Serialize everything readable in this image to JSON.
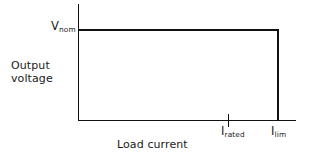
{
  "figure": {
    "background_color": "#ffffff",
    "line_color": "#111111",
    "text_color": "#1a1a1a"
  },
  "axes": {
    "y_axis_label_line1": "Output",
    "y_axis_label_line2": "voltage",
    "x_axis_label": "Load current"
  },
  "markers": {
    "v_nom_symbol": "V",
    "v_nom_subscript": "nom",
    "i_rated_symbol": "I",
    "i_rated_subscript": "rated",
    "i_lim_symbol": "I",
    "i_lim_subscript": "lim"
  },
  "chart_data": {
    "type": "line",
    "title": "",
    "xlabel": "Load current",
    "ylabel": "Output voltage",
    "grid": false,
    "legend": "none",
    "xlim": [
      0,
      1.18
    ],
    "ylim": [
      0,
      1.25
    ],
    "x_tick_labels": [
      "I_rated",
      "I_lim"
    ],
    "x_tick_values": [
      0.75,
      1.0
    ],
    "y_tick_labels": [
      "V_nom"
    ],
    "y_tick_values": [
      1.0
    ],
    "annotations": [
      {
        "text": "V_nom",
        "x": 0.0,
        "y": 1.0,
        "position": "left-of-axis"
      },
      {
        "text": "I_rated",
        "x": 0.75,
        "y": 0.0,
        "position": "below-axis"
      },
      {
        "text": "I_lim",
        "x": 1.0,
        "y": 0.0,
        "position": "below-axis"
      }
    ],
    "series": [
      {
        "name": "Output voltage characteristic",
        "description": "Constant nominal voltage up to the current limit, then abrupt foldback to zero",
        "x": [
          0.0,
          1.0,
          1.0
        ],
        "y": [
          1.0,
          1.0,
          0.0
        ]
      }
    ]
  }
}
